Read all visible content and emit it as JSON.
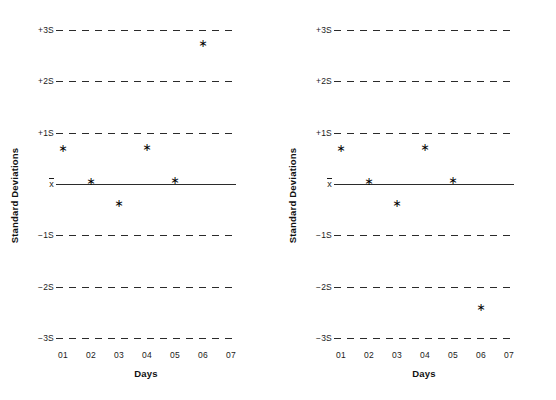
{
  "figure": {
    "background_color": "#ffffff",
    "ink_color": "#1a1a1a",
    "point_marker": "∗",
    "panel_count": 2
  },
  "chart_data": [
    {
      "id": "left",
      "type": "scatter",
      "title": "",
      "xlabel": "Days",
      "ylabel": "Standard Deviations",
      "grid": true,
      "legend": "none",
      "marker": "star",
      "categories": [
        "01",
        "02",
        "03",
        "04",
        "05",
        "06",
        "07"
      ],
      "x": [
        1,
        2,
        3,
        4,
        5,
        6
      ],
      "values": [
        0.68,
        0.04,
        -0.39,
        0.7,
        0.06,
        2.72
      ],
      "ylim": [
        -3,
        3
      ],
      "ytick_values": [
        3,
        2,
        1,
        0,
        -1,
        -2,
        -3
      ],
      "ytick_labels": [
        "+3S",
        "+2S",
        "+1S",
        "x̄",
        "−1S",
        "−2S",
        "−3S"
      ],
      "mean_line_value": 0,
      "control_limit_lines": [
        3,
        2,
        1,
        -1,
        -2,
        -3
      ],
      "annotations": []
    },
    {
      "id": "right",
      "type": "scatter",
      "title": "",
      "xlabel": "Days",
      "ylabel": "Standard Deviations",
      "grid": true,
      "legend": "none",
      "marker": "star",
      "categories": [
        "01",
        "02",
        "03",
        "04",
        "05",
        "06",
        "07"
      ],
      "x": [
        1,
        2,
        3,
        4,
        5,
        6
      ],
      "values": [
        0.68,
        0.04,
        -0.39,
        0.7,
        0.06,
        -2.42
      ],
      "ylim": [
        -3,
        3
      ],
      "ytick_values": [
        3,
        2,
        1,
        0,
        -1,
        -2,
        -3
      ],
      "ytick_labels": [
        "+3S",
        "+2S",
        "+1S",
        "x̄",
        "−1S",
        "−2S",
        "−3S"
      ],
      "mean_line_value": 0,
      "control_limit_lines": [
        3,
        2,
        1,
        -1,
        -2,
        -3
      ],
      "annotations": []
    }
  ]
}
